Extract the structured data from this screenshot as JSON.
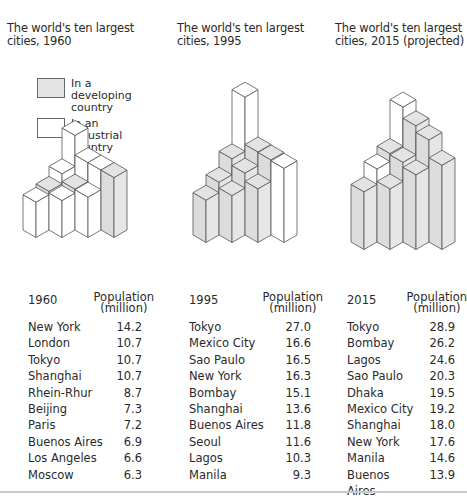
{
  "colors": {
    "developing": "#e3e3e3",
    "industrial": "#ffffff",
    "outline": "#555555"
  },
  "legend": {
    "items": [
      {
        "label": "In a developing\ncountry",
        "type": "developing"
      },
      {
        "label": "In an industrial\ncountry",
        "type": "industrial"
      }
    ]
  },
  "panels": [
    {
      "title": "The world's ten largest\ncities, 1960",
      "year_header": "1960",
      "pop_header": "Population\n(million)"
    },
    {
      "title": "The world's ten largest\ncities, 1995",
      "year_header": "1995",
      "pop_header": "Population\n(million)"
    },
    {
      "title": "The world's ten largest\ncities, 2015 (projected)",
      "year_header": "2015",
      "pop_header": "Population\n(million)"
    }
  ],
  "chart_data": [
    {
      "type": "table",
      "title": "The world's ten largest cities, 1960",
      "columns": [
        "1960",
        "Population (million)"
      ],
      "categories": [
        "New York",
        "London",
        "Tokyo",
        "Shanghai",
        "Rhein-Rhur",
        "Beijing",
        "Paris",
        "Buenos Aires",
        "Los Angeles",
        "Moscow"
      ],
      "values": [
        14.2,
        10.7,
        10.7,
        10.7,
        8.7,
        7.3,
        7.2,
        6.9,
        6.6,
        6.3
      ],
      "country_type": [
        "industrial",
        "industrial",
        "industrial",
        "developing",
        "industrial",
        "developing",
        "industrial",
        "developing",
        "industrial",
        "industrial"
      ],
      "grid": [
        [
          0,
          0
        ],
        [
          0,
          1
        ],
        [
          0,
          2
        ],
        [
          0,
          3
        ],
        [
          1,
          0
        ],
        [
          1,
          1
        ],
        [
          1,
          2
        ],
        [
          2,
          0
        ],
        [
          2,
          1
        ],
        [
          3,
          0
        ]
      ]
    },
    {
      "type": "table",
      "title": "The world's ten largest cities, 1995",
      "columns": [
        "1995",
        "Population (million)"
      ],
      "categories": [
        "Tokyo",
        "Mexico City",
        "Sao Paulo",
        "New York",
        "Bombay",
        "Shanghai",
        "Buenos Aires",
        "Seoul",
        "Lagos",
        "Manila"
      ],
      "values": [
        27.0,
        16.6,
        16.5,
        16.3,
        15.1,
        13.6,
        11.8,
        11.6,
        10.3,
        9.3
      ],
      "country_type": [
        "industrial",
        "developing",
        "developing",
        "industrial",
        "developing",
        "developing",
        "developing",
        "developing",
        "developing",
        "developing"
      ],
      "grid": [
        [
          0,
          0
        ],
        [
          0,
          1
        ],
        [
          0,
          2
        ],
        [
          0,
          3
        ],
        [
          1,
          0
        ],
        [
          1,
          1
        ],
        [
          1,
          2
        ],
        [
          2,
          0
        ],
        [
          2,
          1
        ],
        [
          3,
          0
        ]
      ]
    },
    {
      "type": "table",
      "title": "The world's ten largest cities, 2015 (projected)",
      "columns": [
        "2015",
        "Population (million)"
      ],
      "categories": [
        "Tokyo",
        "Bombay",
        "Lagos",
        "Sao Paulo",
        "Dhaka",
        "Mexico City",
        "Shanghai",
        "New York",
        "Manila",
        "Buenos Aires"
      ],
      "values": [
        28.9,
        26.2,
        24.6,
        20.3,
        19.5,
        19.2,
        18.0,
        17.6,
        14.6,
        13.9
      ],
      "country_type": [
        "industrial",
        "developing",
        "developing",
        "developing",
        "developing",
        "developing",
        "developing",
        "industrial",
        "developing",
        "developing"
      ],
      "grid": [
        [
          0,
          0
        ],
        [
          0,
          1
        ],
        [
          0,
          2
        ],
        [
          0,
          3
        ],
        [
          1,
          0
        ],
        [
          1,
          1
        ],
        [
          1,
          2
        ],
        [
          2,
          0
        ],
        [
          2,
          1
        ],
        [
          3,
          0
        ]
      ]
    }
  ]
}
